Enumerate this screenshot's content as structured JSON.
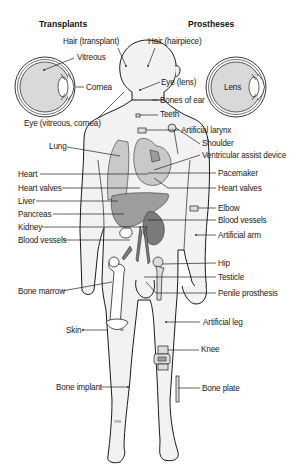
{
  "headings": {
    "transplants": "Transplants",
    "prostheses": "Prostheses"
  },
  "eye_left": {
    "labels": {
      "vitreous": "Vitreous",
      "cornea": "Cornea"
    }
  },
  "eye_right": {
    "labels": {
      "lens": "Lens"
    }
  },
  "labels_left": [
    "Hair (transplant)",
    "Eye (vitreous, cornea)",
    "Lung",
    "Heart",
    "Heart valves",
    "Liver",
    "Pancreas",
    "Kidney",
    "Blood vessels",
    "Bone marrow",
    "Skin",
    "Bone implant"
  ],
  "labels_right": [
    "Hair (hairpiece)",
    "Eye (lens)",
    "Bones of ear",
    "Teeth",
    "Artificial larynx",
    "Shoulder",
    "Ventricular assist device",
    "Pacemaker",
    "Heart valves",
    "Elbow",
    "Blood vessels",
    "Artificial arm",
    "Hip",
    "Testicle",
    "Penile prosthesis",
    "Artificial leg",
    "Knee",
    "Bone plate"
  ],
  "signature": "NW"
}
